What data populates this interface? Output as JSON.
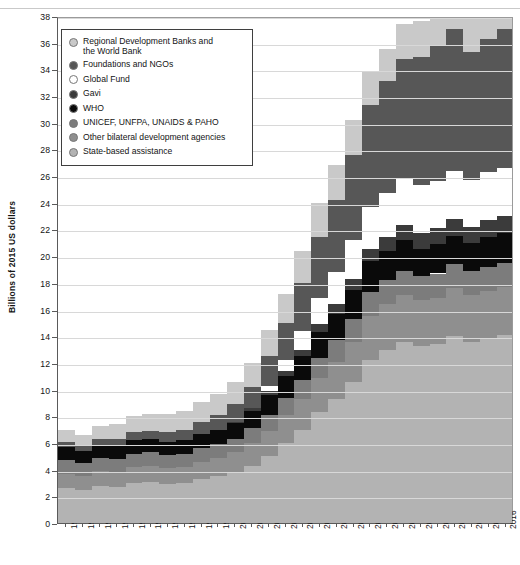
{
  "chart_data": {
    "type": "area",
    "subtype": "stacked-step-area",
    "title": "",
    "xlabel": "",
    "ylabel": "Billions of 2015 US dollars",
    "ylim": [
      0,
      38
    ],
    "ytick_step": 2,
    "yticks": [
      0,
      2,
      4,
      6,
      8,
      10,
      12,
      14,
      16,
      18,
      20,
      22,
      24,
      26,
      28,
      30,
      32,
      34,
      36,
      38
    ],
    "grid": true,
    "legend_position": "top-left-inside",
    "categories": [
      "1990",
      "1991",
      "1992",
      "1993",
      "1994",
      "1995",
      "1996",
      "1997",
      "1998",
      "1999",
      "2000",
      "2001",
      "2002",
      "2003",
      "2004",
      "2005",
      "2006",
      "2007",
      "2008",
      "2009",
      "2010",
      "2011",
      "2012",
      "2013",
      "2014",
      "2015",
      "2016"
    ],
    "stack_order_bottom_to_top": [
      "State-based assistance",
      "Other bilateral development agencies",
      "UNICEF, UNFPA, UNAIDS & PAHO",
      "WHO",
      "Gavi",
      "Global Fund",
      "Foundations and NGOs",
      "Regional Development Banks and the World Bank"
    ],
    "series": [
      {
        "name": "State-based assistance",
        "color": "#b3b3b3",
        "values": [
          2.6,
          2.5,
          2.8,
          2.7,
          3.0,
          3.1,
          2.9,
          3.0,
          3.3,
          3.5,
          3.8,
          4.3,
          5.0,
          6.0,
          7.0,
          8.3,
          9.3,
          10.6,
          12.2,
          13.0,
          13.6,
          13.3,
          13.4,
          14.0,
          13.6,
          13.8,
          14.1
        ]
      },
      {
        "name": "Other bilateral development agencies",
        "color": "#8f8f8f",
        "values": [
          1.1,
          1.0,
          1.1,
          1.1,
          1.2,
          1.2,
          1.2,
          1.2,
          1.3,
          1.4,
          1.5,
          1.7,
          1.9,
          2.1,
          2.3,
          2.6,
          2.8,
          3.0,
          3.3,
          3.4,
          3.5,
          3.4,
          3.5,
          3.6,
          3.5,
          3.6,
          3.6
        ]
      },
      {
        "name": "UNICEF, UNFPA, UNAIDS & PAHO",
        "color": "#7c7c7c",
        "values": [
          1.0,
          1.0,
          1.0,
          1.0,
          1.0,
          1.0,
          1.0,
          1.0,
          1.0,
          1.0,
          1.0,
          1.1,
          1.2,
          1.3,
          1.4,
          1.5,
          1.6,
          1.7,
          1.8,
          1.8,
          1.8,
          1.8,
          1.8,
          1.8,
          1.8,
          1.8,
          1.8
        ]
      },
      {
        "name": "WHO",
        "color": "#0a0a0a",
        "values": [
          1.0,
          0.9,
          0.9,
          1.0,
          1.0,
          1.0,
          1.0,
          1.0,
          1.1,
          1.1,
          1.2,
          1.3,
          1.5,
          1.6,
          1.8,
          1.9,
          2.0,
          2.2,
          2.3,
          2.2,
          2.3,
          2.0,
          2.2,
          2.1,
          2.1,
          2.2,
          2.2
        ]
      },
      {
        "name": "Gavi",
        "color": "#3b3b3b",
        "values": [
          0.0,
          0.0,
          0.0,
          0.0,
          0.0,
          0.0,
          0.0,
          0.0,
          0.0,
          0.0,
          0.1,
          0.2,
          0.3,
          0.4,
          0.5,
          0.6,
          0.7,
          0.8,
          0.9,
          1.0,
          1.1,
          1.2,
          1.2,
          1.3,
          1.2,
          1.3,
          1.3
        ]
      },
      {
        "name": "Global Fund",
        "color": "#ffffff",
        "values": [
          0.0,
          0.0,
          0.0,
          0.0,
          0.0,
          0.0,
          0.0,
          0.0,
          0.0,
          0.0,
          0.0,
          0.0,
          0.4,
          0.8,
          1.4,
          2.0,
          2.4,
          2.9,
          3.2,
          3.3,
          3.5,
          3.6,
          3.5,
          3.6,
          3.5,
          3.6,
          3.6
        ]
      },
      {
        "name": "Foundations and NGOs",
        "color": "#575757",
        "values": [
          0.4,
          0.4,
          0.5,
          0.5,
          0.6,
          0.6,
          0.7,
          0.8,
          0.9,
          1.1,
          1.3,
          1.6,
          2.2,
          2.8,
          3.6,
          4.5,
          5.4,
          6.4,
          7.6,
          8.4,
          9.0,
          9.6,
          10.2,
          10.6,
          9.6,
          10.0,
          10.4
        ]
      },
      {
        "name": "Regional Development Banks and the World Bank",
        "color": "#c9c9c9",
        "values": [
          0.9,
          0.8,
          1.0,
          1.1,
          1.2,
          1.3,
          1.4,
          1.4,
          1.5,
          1.6,
          1.7,
          1.8,
          2.0,
          2.2,
          2.4,
          2.6,
          2.6,
          2.6,
          2.6,
          2.4,
          2.6,
          2.7,
          2.8,
          2.9,
          2.9,
          2.7,
          2.5
        ]
      }
    ],
    "totals": [
      7.0,
      6.6,
      7.3,
      7.4,
      8.0,
      8.2,
      8.2,
      8.4,
      9.1,
      9.7,
      10.6,
      12.0,
      14.5,
      17.2,
      20.4,
      24.0,
      26.8,
      30.2,
      33.9,
      35.5,
      37.4,
      37.6,
      38.6,
      39.9,
      38.2,
      39.0,
      39.5
    ]
  },
  "legend": {
    "items": [
      {
        "label": "Regional Development Banks and\nthe World Bank",
        "color": "#c9c9c9"
      },
      {
        "label": "Foundations and NGOs",
        "color": "#575757"
      },
      {
        "label": "Global Fund",
        "color": "#ffffff"
      },
      {
        "label": "Gavi",
        "color": "#3b3b3b"
      },
      {
        "label": "WHO",
        "color": "#0a0a0a"
      },
      {
        "label": "UNICEF, UNFPA, UNAIDS & PAHO",
        "color": "#7c7c7c"
      },
      {
        "label": "Other bilateral development agencies",
        "color": "#8f8f8f"
      },
      {
        "label": "State-based assistance",
        "color": "#b3b3b3"
      }
    ]
  }
}
